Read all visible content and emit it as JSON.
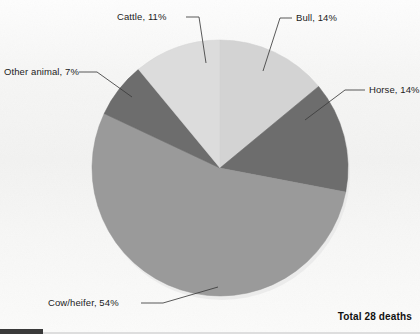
{
  "chart_data": {
    "type": "pie",
    "title": "",
    "subtitle": "",
    "xlabel": "",
    "ylabel": "",
    "grid": false,
    "legend_position": "none",
    "labels_style": "callout-leader-lines",
    "start_angle_clock_position": "12 o'clock",
    "direction": "clockwise",
    "total_annotation": "Total 28  deaths",
    "total_count": 28,
    "units": "deaths",
    "categories": [
      "Bull",
      "Horse",
      "Cow/heifer",
      "Other animal",
      "Cattle"
    ],
    "values": [
      14,
      14,
      54,
      7,
      11
    ],
    "value_units": "percent",
    "colors": [
      "#d3d3d3",
      "#6d6d6d",
      "#9a9a9a",
      "#6d6d6d",
      "#dcdcdc"
    ],
    "slices": [
      {
        "label": "Bull",
        "value": 14,
        "display": "Bull, 14%",
        "color": "#d3d3d3"
      },
      {
        "label": "Horse",
        "value": 14,
        "display": "Horse, 14%",
        "color": "#6d6d6d"
      },
      {
        "label": "Cow/heifer",
        "value": 54,
        "display": "Cow/heifer, 54%",
        "color": "#9a9a9a"
      },
      {
        "label": "Other animal",
        "value": 7,
        "display": "Other animal, 7%",
        "color": "#6d6d6d"
      },
      {
        "label": "Cattle",
        "value": 11,
        "display": "Cattle, 11%",
        "color": "#dcdcdc"
      }
    ]
  },
  "callouts": {
    "cattle": "Cattle, 11%",
    "bull": "Bull, 14%",
    "horse": "Horse, 14%",
    "other_animal": "Other animal, 7%",
    "cow_heifer": "Cow/heifer, 54%"
  },
  "footer": {
    "total": "Total 28  deaths"
  },
  "colors": {
    "background": "#f7f7f6",
    "leader_line": "#3c3c3c",
    "text": "#1c1c1c",
    "slice_light": "#dcdcdc",
    "slice_bull": "#d3d3d3",
    "slice_mid": "#9a9a9a",
    "slice_dark": "#6d6d6d",
    "edge_artifact": "#3a3a3a"
  }
}
